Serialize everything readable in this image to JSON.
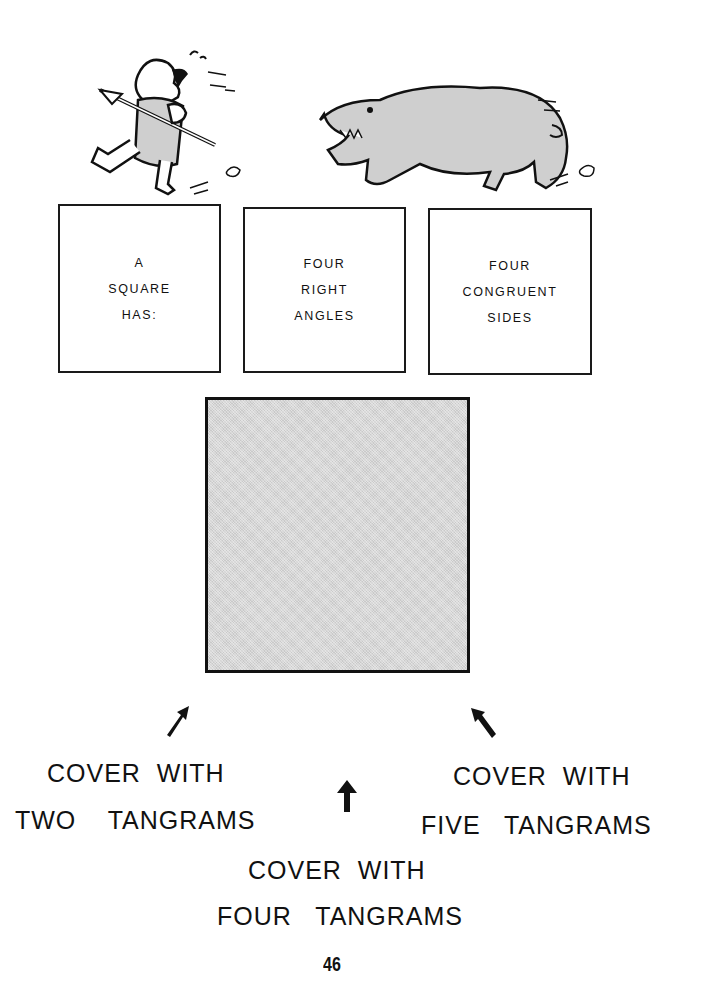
{
  "illustrations": {
    "caveman": "caveman-running-with-spear",
    "bear": "bear-chasing"
  },
  "definition_boxes": [
    {
      "lines": [
        "A",
        "SQUARE",
        "HAS:"
      ]
    },
    {
      "lines": [
        "FOUR",
        "RIGHT",
        "ANGLES"
      ]
    },
    {
      "lines": [
        "FOUR",
        "CONGRUENT",
        "SIDES"
      ]
    }
  ],
  "square_shape": {
    "fill": "#d6d6d6",
    "border": "#111111"
  },
  "instructions": {
    "left": {
      "line1": "COVER  WITH",
      "line2": "TWO    TANGRAMS",
      "arrow": "arrow-up-right-icon"
    },
    "center": {
      "line1": "COVER  WITH",
      "line2": "FOUR   TANGRAMS",
      "arrow": "arrow-up-icon"
    },
    "right": {
      "line1": "COVER  WITH",
      "line2": "FIVE   TANGRAMS",
      "arrow": "arrow-up-left-icon"
    }
  },
  "page_number": "46"
}
